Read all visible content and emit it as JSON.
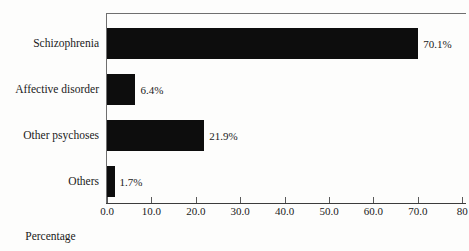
{
  "chart_data": {
    "type": "bar",
    "orientation": "horizontal",
    "title": "",
    "xlabel": "Percentage",
    "ylabel": "",
    "xlim": [
      0,
      80
    ],
    "grid": false,
    "legend": null,
    "categories": [
      "Schizophrenia",
      "Affective disorder",
      "Other psychoses",
      "Others"
    ],
    "values": [
      70.1,
      6.4,
      21.9,
      1.7
    ],
    "data_labels": [
      "70.1%",
      "6.4%",
      "21.9%",
      "1.7%"
    ],
    "xticks": [
      0,
      10,
      20,
      30,
      40,
      50,
      60,
      70,
      80
    ],
    "xtick_labels": [
      "0.0",
      "10.0",
      "20.0",
      "30.0",
      "40.0",
      "50.0",
      "60.0",
      "70.0",
      "80"
    ],
    "bar_color": "#0d0d0d",
    "axis_color": "#3c3c3c",
    "background_color": "#fdfdfc"
  }
}
